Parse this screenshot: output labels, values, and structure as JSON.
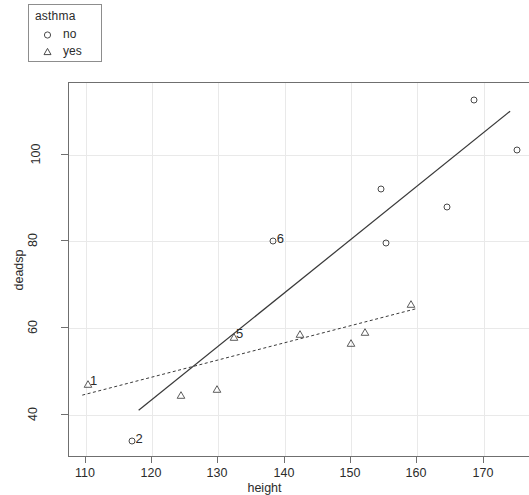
{
  "chart_data": {
    "type": "scatter",
    "title": "",
    "xlabel": "height",
    "ylabel": "deadsp",
    "xlim": [
      107.5,
      177.0
    ],
    "ylim": [
      30.0,
      116.5
    ],
    "xticks": [
      110,
      120,
      130,
      140,
      150,
      160,
      170
    ],
    "yticks": [
      40,
      60,
      80,
      100
    ],
    "grid": true,
    "legend": {
      "title": "asthma",
      "position": "top-left-outside",
      "entries": [
        {
          "label": "no",
          "marker": "circle"
        },
        {
          "label": "yes",
          "marker": "triangle"
        }
      ]
    },
    "series": [
      {
        "name": "no",
        "marker": "circle",
        "points": [
          {
            "x": 117.0,
            "y": 34.0,
            "label": "2"
          },
          {
            "x": 138.3,
            "y": 80.0,
            "label": "6"
          },
          {
            "x": 154.5,
            "y": 92.0,
            "label": ""
          },
          {
            "x": 155.3,
            "y": 79.5,
            "label": ""
          },
          {
            "x": 164.5,
            "y": 88.0,
            "label": ""
          },
          {
            "x": 168.5,
            "y": 112.5,
            "label": ""
          },
          {
            "x": 175.0,
            "y": 101.0,
            "label": ""
          }
        ],
        "fit_line": {
          "style": "solid",
          "x_start": 118.0,
          "y_start": 41.0,
          "x_end": 174.0,
          "y_end": 110.0
        }
      },
      {
        "name": "yes",
        "marker": "triangle",
        "points": [
          {
            "x": 110.3,
            "y": 47.0,
            "label": "1"
          },
          {
            "x": 124.4,
            "y": 44.5,
            "label": ""
          },
          {
            "x": 129.8,
            "y": 46.0,
            "label": ""
          },
          {
            "x": 132.3,
            "y": 58.0,
            "label": "5"
          },
          {
            "x": 142.4,
            "y": 58.5,
            "label": ""
          },
          {
            "x": 150.0,
            "y": 56.5,
            "label": ""
          },
          {
            "x": 152.1,
            "y": 59.0,
            "label": ""
          },
          {
            "x": 159.0,
            "y": 65.5,
            "label": ""
          }
        ],
        "fit_line": {
          "style": "dashed",
          "x_start": 109.5,
          "y_start": 44.5,
          "x_end": 160.0,
          "y_end": 64.5
        }
      }
    ],
    "annotations": [
      {
        "text": "1",
        "x": 110.3,
        "y": 47.0
      },
      {
        "text": "2",
        "x": 117.0,
        "y": 34.0
      },
      {
        "text": "5",
        "x": 132.3,
        "y": 58.0
      },
      {
        "text": "6",
        "x": 138.3,
        "y": 80.0
      }
    ],
    "colors": {
      "point": "#4a4a4a",
      "line": "#3a3a3a",
      "grid": "#e9e9e9",
      "axis": "#6f6f6f",
      "text": "#2b2b2b",
      "background": "#ffffff"
    }
  },
  "axes": {
    "x_tick_labels": [
      "110",
      "120",
      "130",
      "140",
      "150",
      "160",
      "170"
    ],
    "y_tick_labels": [
      "40",
      "60",
      "80",
      "100"
    ],
    "x_title": "height",
    "y_title": "deadsp"
  },
  "legend": {
    "title": "asthma",
    "items": [
      {
        "label": "no"
      },
      {
        "label": "yes"
      }
    ]
  }
}
